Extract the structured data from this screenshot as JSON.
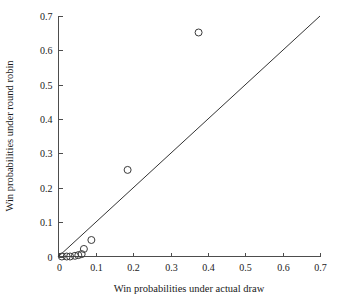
{
  "chart_data": {
    "type": "scatter",
    "title": "",
    "xlabel": "Win probabilities under actual draw",
    "ylabel": "Win probabilities under round robin",
    "xlim": [
      0,
      0.7
    ],
    "ylim": [
      0,
      0.7
    ],
    "xticks": [
      "0",
      "0.1",
      "0.2",
      "0.3",
      "0.4",
      "0.5",
      "0.6",
      "0.7"
    ],
    "xtick_values": [
      0,
      0.1,
      0.2,
      0.3,
      0.4,
      0.5,
      0.6,
      0.7
    ],
    "yticks": [
      "0",
      "0.1",
      "0.2",
      "0.3",
      "0.4",
      "0.5",
      "0.6",
      "0.7"
    ],
    "ytick_values": [
      0,
      0.1,
      0.2,
      0.3,
      0.4,
      0.5,
      0.6,
      0.7
    ],
    "grid": false,
    "legend": false,
    "marker": "open-circle",
    "marker_size": 7,
    "series": [
      {
        "name": "teams",
        "points": [
          {
            "x": 0.009,
            "y": 0.0
          },
          {
            "x": 0.022,
            "y": 0.0
          },
          {
            "x": 0.031,
            "y": 0.0
          },
          {
            "x": 0.044,
            "y": 0.002
          },
          {
            "x": 0.053,
            "y": 0.004
          },
          {
            "x": 0.062,
            "y": 0.007
          },
          {
            "x": 0.068,
            "y": 0.022
          },
          {
            "x": 0.088,
            "y": 0.048
          },
          {
            "x": 0.185,
            "y": 0.252
          },
          {
            "x": 0.375,
            "y": 0.652
          }
        ]
      }
    ],
    "reference_line": {
      "name": "identity-line",
      "from": {
        "x": 0.0,
        "y": 0.0
      },
      "to": {
        "x": 0.7,
        "y": 0.7
      }
    }
  }
}
